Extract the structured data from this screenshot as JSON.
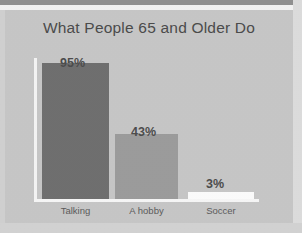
{
  "chart_data": {
    "type": "bar",
    "title": "What People 65 and Older Do",
    "categories": [
      "Talking",
      "A hobby",
      "Soccer"
    ],
    "values": [
      95,
      43,
      3
    ],
    "value_labels": [
      "95%",
      "43%",
      "3%"
    ],
    "xlabel": "",
    "ylabel": "",
    "ylim": [
      0,
      100
    ],
    "grid": false,
    "legend": false,
    "unit": "%",
    "colors": {
      "bar_1": "#6e6e6e",
      "bar_2": "#9b9b9b",
      "bar_3": "#fbfbfb",
      "background": "#c6c6c6",
      "axis": "#f4f4f4",
      "title_text": "#4a4a4a",
      "value_text": "#4b4b4b",
      "category_text": "#5a5a5a"
    }
  }
}
